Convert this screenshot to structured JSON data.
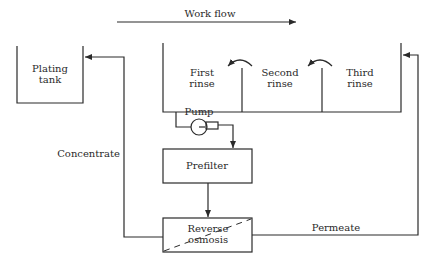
{
  "diagram": {
    "workflow_label": "Work flow",
    "plating_tank": {
      "line1": "Plating",
      "line2": "tank"
    },
    "rinses": [
      {
        "line1": "First",
        "line2": "rinse"
      },
      {
        "line1": "Second",
        "line2": "rinse"
      },
      {
        "line1": "Third",
        "line2": "rinse"
      }
    ],
    "pump_label": "Pump",
    "prefilter_label": "Prefilter",
    "reverse_osmosis": {
      "line1": "Reverse",
      "line2": "osmosis"
    },
    "concentrate_label": "Concentrate",
    "permeate_label": "Permeate"
  }
}
